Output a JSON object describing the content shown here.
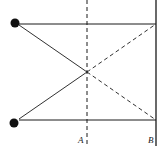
{
  "diagram": {
    "type": "optics-ray-diagram",
    "labels": {
      "a": "A",
      "b": "B"
    },
    "caption_partial": "",
    "elements": {
      "sources": [
        {
          "id": "top-source",
          "x": 15,
          "y": 23
        },
        {
          "id": "bottom-source",
          "x": 15,
          "y": 123
        }
      ],
      "line_a": {
        "style": "dashed",
        "x": 87
      },
      "line_b": {
        "style": "solid",
        "x": 156
      },
      "crossing_point": {
        "x": 87,
        "y": 72
      }
    },
    "colors": {
      "stroke": "#1a1a1a",
      "background": "#ffffff"
    }
  }
}
